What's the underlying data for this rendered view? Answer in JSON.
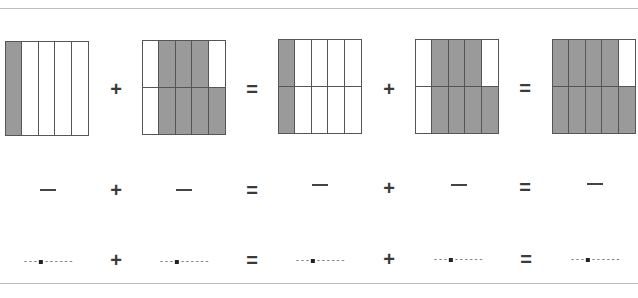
{
  "worksheet": {
    "models": [
      {
        "cols": 5,
        "rows": 1,
        "shaded": [
          [
            1,
            0,
            0,
            0,
            0
          ]
        ]
      },
      {
        "cols": 5,
        "rows": 2,
        "shaded": [
          [
            0,
            1,
            1,
            1,
            0
          ],
          [
            0,
            1,
            1,
            1,
            1
          ]
        ]
      },
      {
        "cols": 5,
        "rows": 2,
        "shaded": [
          [
            1,
            0,
            0,
            0,
            0
          ],
          [
            1,
            0,
            0,
            0,
            0
          ]
        ]
      },
      {
        "cols": 5,
        "rows": 2,
        "shaded": [
          [
            0,
            1,
            1,
            1,
            0
          ],
          [
            0,
            1,
            1,
            1,
            1
          ]
        ]
      },
      {
        "cols": 5,
        "rows": 2,
        "shaded": [
          [
            1,
            1,
            1,
            1,
            0
          ],
          [
            1,
            1,
            1,
            1,
            1
          ]
        ]
      }
    ],
    "operators": {
      "plus": "+",
      "equals": "="
    },
    "fraction_blank": "—",
    "decimal_blank": {
      "left": "---",
      "right": "------"
    },
    "colors": {
      "shade": "#9a9a9a",
      "line": "#555555",
      "rule": "#bdbdbd"
    }
  }
}
